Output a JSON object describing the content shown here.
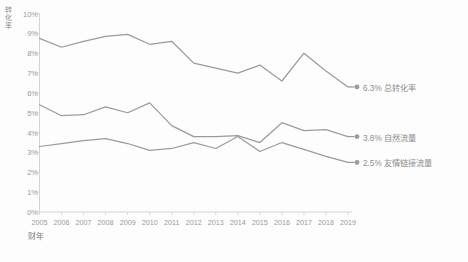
{
  "chart_data": {
    "type": "line",
    "title": "",
    "xlabel": "财年",
    "ylabel": "转化率",
    "x": [
      "2005",
      "2006",
      "2007",
      "2008",
      "2009",
      "2010",
      "2011",
      "2012",
      "2013",
      "2014",
      "2015",
      "2016",
      "2017",
      "2018",
      "2019"
    ],
    "categories": [
      "2005",
      "2006",
      "2007",
      "2008",
      "2009",
      "2010",
      "2011",
      "2012",
      "2013",
      "2014",
      "2015",
      "2016",
      "2017",
      "2018",
      "2019"
    ],
    "ylim": [
      0,
      10
    ],
    "ytick_labels": [
      "0%",
      "1%",
      "2%",
      "3%",
      "4%",
      "5%",
      "6%",
      "7%",
      "8%",
      "9%",
      "10%"
    ],
    "ytick_values": [
      0,
      1,
      2,
      3,
      4,
      5,
      6,
      7,
      8,
      9,
      10
    ],
    "grid": false,
    "legend": "end-of-line labels",
    "series": [
      {
        "name": "总转化率",
        "end_label": "6.3% 总转化率",
        "end_value": "6.3%",
        "color": "#9b9b9b",
        "values": [
          8.75,
          8.3,
          8.6,
          8.85,
          8.95,
          8.45,
          8.6,
          7.5,
          7.25,
          7.0,
          7.4,
          6.6,
          8.0,
          7.1,
          6.3
        ]
      },
      {
        "name": "自然流量",
        "end_label": "3.8% 自然流量",
        "end_value": "3.8%",
        "color": "#9b9b9b",
        "values": [
          5.4,
          4.85,
          4.9,
          5.3,
          5.0,
          5.5,
          4.35,
          3.8,
          3.8,
          3.85,
          3.5,
          4.5,
          4.1,
          4.15,
          3.8
        ]
      },
      {
        "name": "友情链接流量",
        "end_label": "2.5% 友情链接流量",
        "end_value": "2.5%",
        "color": "#9b9b9b",
        "values": [
          3.3,
          3.45,
          3.6,
          3.7,
          3.45,
          3.1,
          3.2,
          3.5,
          3.2,
          3.8,
          3.05,
          3.5,
          3.15,
          2.8,
          2.5
        ]
      }
    ],
    "colors": {
      "line": "#9b9b9b",
      "axis": "#c9c9c9",
      "text": "#9b9b9b",
      "background": "#fdfdfd"
    }
  }
}
